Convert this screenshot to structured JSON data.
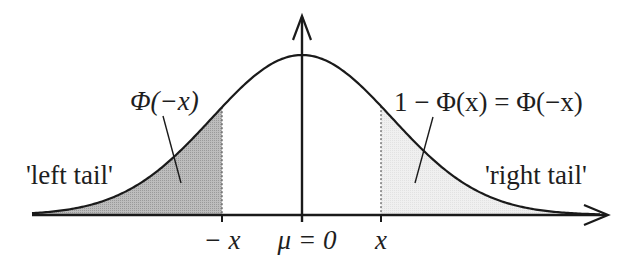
{
  "figure": {
    "colors": {
      "curve": "#1a1a1a",
      "axis": "#1a1a1a",
      "left_tail_fill": "#b4b4b4",
      "right_tail_fill": "#ececec",
      "text": "#1e1e1e"
    },
    "labels": {
      "left_area": "Φ(−x)",
      "right_area": "1 − Φ(x) = Φ(−x)",
      "left_tail": "'left tail'",
      "right_tail": "'right tail'"
    },
    "ticks": [
      {
        "label": "− x",
        "position": "-x"
      },
      {
        "label": "μ = 0",
        "position": "0"
      },
      {
        "label": "x",
        "position": "x"
      }
    ],
    "axes": {
      "x_arrow": "right",
      "y_arrow": "up"
    }
  }
}
